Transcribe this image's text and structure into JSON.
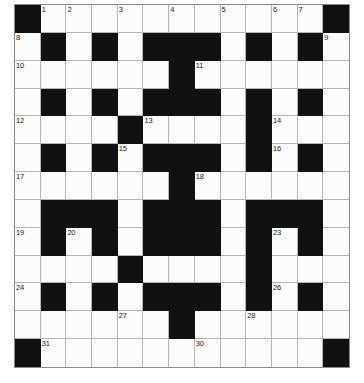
{
  "puzzle": {
    "title": "Crossword Grid",
    "type": "crossword",
    "columns": 13,
    "rows": 13,
    "colors": {
      "block": "#111111",
      "cell": "#fbfbfb",
      "gridline": "#b5b5b5",
      "border": "#8a8a8a",
      "number": "#1a1a1a",
      "background": "#ffffff"
    },
    "blocks": [
      [
        0,
        0
      ],
      [
        0,
        12
      ],
      [
        1,
        1
      ],
      [
        1,
        3
      ],
      [
        1,
        5
      ],
      [
        1,
        6
      ],
      [
        1,
        7
      ],
      [
        1,
        9
      ],
      [
        1,
        11
      ],
      [
        2,
        6
      ],
      [
        3,
        1
      ],
      [
        3,
        3
      ],
      [
        3,
        5
      ],
      [
        3,
        6
      ],
      [
        3,
        7
      ],
      [
        3,
        9
      ],
      [
        3,
        11
      ],
      [
        4,
        4
      ],
      [
        4,
        9
      ],
      [
        5,
        1
      ],
      [
        5,
        3
      ],
      [
        5,
        5
      ],
      [
        5,
        6
      ],
      [
        5,
        7
      ],
      [
        5,
        9
      ],
      [
        5,
        11
      ],
      [
        6,
        6
      ],
      [
        7,
        1
      ],
      [
        7,
        2
      ],
      [
        7,
        3
      ],
      [
        7,
        5
      ],
      [
        7,
        6
      ],
      [
        7,
        7
      ],
      [
        7,
        9
      ],
      [
        7,
        10
      ],
      [
        7,
        11
      ],
      [
        8,
        1
      ],
      [
        8,
        3
      ],
      [
        8,
        5
      ],
      [
        8,
        6
      ],
      [
        8,
        7
      ],
      [
        8,
        9
      ],
      [
        8,
        11
      ],
      [
        9,
        4
      ],
      [
        9,
        9
      ],
      [
        10,
        1
      ],
      [
        10,
        3
      ],
      [
        10,
        5
      ],
      [
        10,
        6
      ],
      [
        10,
        7
      ],
      [
        10,
        9
      ],
      [
        10,
        11
      ],
      [
        11,
        6
      ],
      [
        12,
        0
      ],
      [
        12,
        12
      ]
    ],
    "numbers": [
      {
        "row": 0,
        "col": 1,
        "n": "1"
      },
      {
        "row": 0,
        "col": 2,
        "n": "2"
      },
      {
        "row": 0,
        "col": 4,
        "n": "3"
      },
      {
        "row": 0,
        "col": 6,
        "n": "4"
      },
      {
        "row": 0,
        "col": 8,
        "n": "5"
      },
      {
        "row": 0,
        "col": 10,
        "n": "6"
      },
      {
        "row": 0,
        "col": 11,
        "n": "7"
      },
      {
        "row": 1,
        "col": 0,
        "n": "8"
      },
      {
        "row": 1,
        "col": 12,
        "n": "9"
      },
      {
        "row": 2,
        "col": 0,
        "n": "10"
      },
      {
        "row": 2,
        "col": 7,
        "n": "11"
      },
      {
        "row": 4,
        "col": 0,
        "n": "12"
      },
      {
        "row": 4,
        "col": 5,
        "n": "13"
      },
      {
        "row": 4,
        "col": 10,
        "n": "14"
      },
      {
        "row": 5,
        "col": 4,
        "n": "15"
      },
      {
        "row": 5,
        "col": 10,
        "n": "16"
      },
      {
        "row": 6,
        "col": 0,
        "n": "17"
      },
      {
        "row": 6,
        "col": 7,
        "n": "18"
      },
      {
        "row": 8,
        "col": 0,
        "n": "19"
      },
      {
        "row": 8,
        "col": 2,
        "n": "20"
      },
      {
        "row": 8,
        "col": 5,
        "n": "21"
      },
      {
        "row": 8,
        "col": 7,
        "n": "22"
      },
      {
        "row": 8,
        "col": 10,
        "n": "23"
      },
      {
        "row": 10,
        "col": 0,
        "n": "24"
      },
      {
        "row": 10,
        "col": 5,
        "n": "25"
      },
      {
        "row": 10,
        "col": 10,
        "n": "26"
      },
      {
        "row": 11,
        "col": 4,
        "n": "27"
      },
      {
        "row": 11,
        "col": 9,
        "n": "28"
      },
      {
        "row": 12,
        "col": 0,
        "n": "29"
      },
      {
        "row": 12,
        "col": 7,
        "n": "30"
      }
    ],
    "numbers_extra": [
      {
        "row": 12,
        "col": 1,
        "n": "31"
      }
    ]
  }
}
